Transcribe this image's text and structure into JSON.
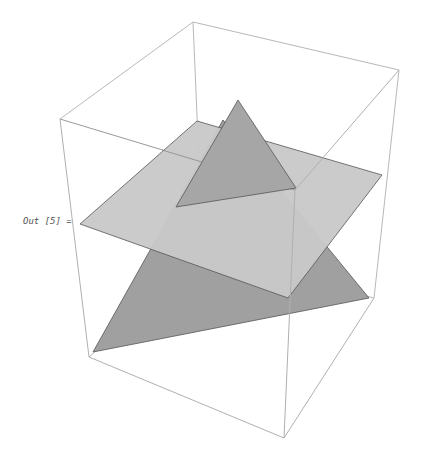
{
  "cell": {
    "output_label": "Out [5] ="
  },
  "graphics3d": {
    "type": "Graphics3D",
    "box_color": "#b5b5b5",
    "colors": {
      "plane": "#c9c9c9",
      "lower_triangle": "#a0a0a0",
      "upper_triangle": "#a6a6a6",
      "edge": "#555555"
    },
    "box": {
      "back_top_left": [
        193,
        22
      ],
      "back_top_right": [
        399,
        70
      ],
      "front_top_left": [
        60,
        119
      ],
      "front_top_right": [
        295,
        190
      ],
      "back_bottom_left": [
        203,
        256
      ],
      "back_bottom_right": [
        374,
        298
      ],
      "front_bottom_left": [
        89,
        357
      ],
      "front_bottom_right": [
        284,
        438
      ]
    },
    "polygons": {
      "lower_triangle": "93,352 369,298 223,120",
      "plane": "80,224 197,121 382,175 288,298",
      "upper_triangle": "238,100 176,207 296,188"
    }
  }
}
